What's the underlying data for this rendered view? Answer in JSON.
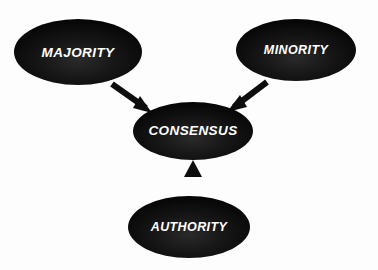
{
  "diagram": {
    "background_color": "#fdfdfd",
    "node_fill_color": "#111111",
    "node_text_color": "#ffffff",
    "arrow_color": "#0d0d0d",
    "nodes": [
      {
        "id": "majority",
        "label": "MAJORITY",
        "cx": 78,
        "cy": 52,
        "rx": 64,
        "ry": 33,
        "font_size": 13.5
      },
      {
        "id": "minority",
        "label": "MINORITY",
        "cx": 296,
        "cy": 50,
        "rx": 60,
        "ry": 31,
        "font_size": 12.5
      },
      {
        "id": "consensus",
        "label": "CONSENSUS",
        "cx": 193,
        "cy": 131,
        "rx": 60,
        "ry": 29,
        "font_size": 13.5
      },
      {
        "id": "authority",
        "label": "AUTHORITY",
        "cx": 189,
        "cy": 227,
        "rx": 61,
        "ry": 31,
        "font_size": 12.5
      }
    ],
    "arrows": [
      {
        "id": "majority-to-consensus",
        "from": "majority",
        "to": "consensus",
        "x1": 112,
        "y1": 84,
        "x2": 150,
        "y2": 111
      },
      {
        "id": "minority-to-consensus",
        "from": "minority",
        "to": "consensus",
        "x1": 267,
        "y1": 82,
        "x2": 229,
        "y2": 111
      },
      {
        "id": "authority-to-consensus",
        "from": "authority",
        "to": "consensus",
        "x1": 193,
        "y1": 200,
        "x2": 193,
        "y2": 163
      }
    ]
  }
}
